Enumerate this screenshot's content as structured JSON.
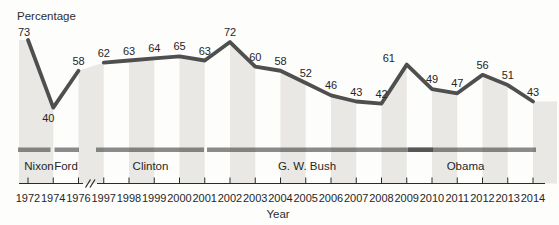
{
  "chart_data": {
    "type": "line",
    "title": "",
    "ylabel": "Percentage",
    "xlabel": "Year",
    "x": [
      1972,
      1974,
      1976,
      1997,
      1998,
      1999,
      2000,
      2001,
      2002,
      2003,
      2004,
      2005,
      2006,
      2007,
      2008,
      2009,
      2010,
      2011,
      2012,
      2013,
      2014
    ],
    "values": [
      73,
      40,
      58,
      62,
      63,
      64,
      65,
      63,
      72,
      60,
      58,
      52,
      46,
      43,
      42,
      61,
      49,
      47,
      56,
      51,
      43
    ],
    "axis_break_between": [
      1976,
      1997
    ],
    "presidents": [
      {
        "name": "Nixon",
        "from": 1972,
        "to": 1974
      },
      {
        "name": "Ford",
        "from": 1974,
        "to": 1976
      },
      {
        "name": "Clinton",
        "from": 1997,
        "to": 2001
      },
      {
        "name": "G. W. Bush",
        "from": 2001,
        "to": 2009
      },
      {
        "name": "Obama",
        "from": 2009,
        "to": 2014
      }
    ],
    "legend": "none",
    "grid": "off",
    "shading": "alternating vertical bands filled under the curve between successive year ticks",
    "colors": {
      "line": "#4f4f4f",
      "band": "#e9e8e4",
      "president_bar": "rgba(45,45,45,0.55)",
      "text": "#262626",
      "axis": "#2a2a2a",
      "background": "#fdfdfc"
    },
    "layout": {
      "x0": 28,
      "dx": 25.25,
      "y_top_value": 73,
      "y_top_px": 40,
      "px_per_unit": 2.05,
      "baseline_px": 183.5,
      "plot_left": 19,
      "plot_right": 557,
      "axis_right": 545,
      "bar_y": 147.5,
      "bar_h": 4.5,
      "president_bars_px": [
        [
          18,
          50.5
        ],
        [
          54.5,
          79
        ],
        [
          96,
          204
        ],
        [
          207,
          433
        ],
        [
          408,
          536
        ]
      ],
      "president_label_px": [
        [
          39,
          170
        ],
        [
          66,
          170
        ],
        [
          150.5,
          170
        ],
        [
          307,
          170
        ],
        [
          465.5,
          170
        ]
      ],
      "value_label_offsets": {
        "0": [
          -4,
          -4
        ],
        "1": [
          -5,
          14
        ],
        "15": [
          -18,
          -3
        ]
      },
      "default_value_label_offset": [
        0,
        -6
      ],
      "value_font": 11,
      "tick_top": 177.5,
      "year_label_baseline": 202,
      "year_font": 11,
      "president_font": 11.5,
      "break_gap": [
        83,
        97
      ]
    }
  }
}
